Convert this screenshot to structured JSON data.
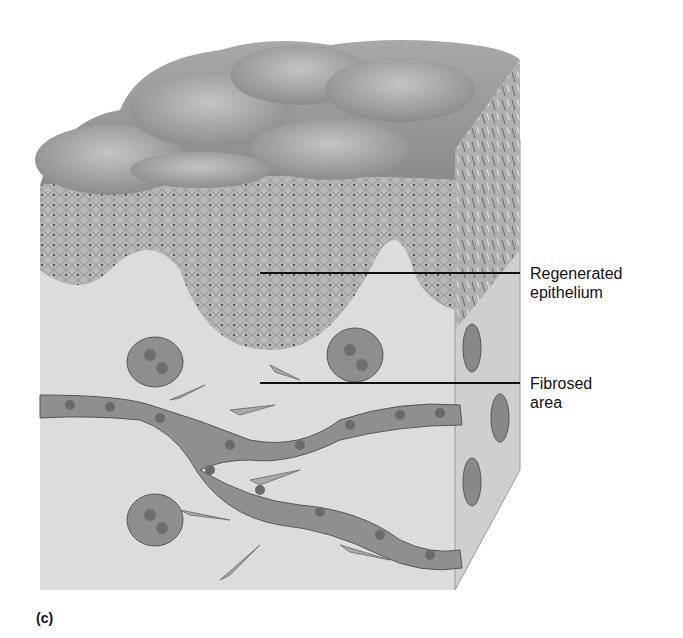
{
  "figure": {
    "panel_label": "(c)",
    "labels": [
      {
        "line1": "Regenerated",
        "line2": "epithelium"
      },
      {
        "line1": "Fibrosed",
        "line2": "area"
      }
    ]
  },
  "colors": {
    "surface": "#9a9a9a",
    "epithelium": "#b5b5b5",
    "connective": "#d9d9d9",
    "vessel": "#8c8c8c",
    "line": "#111111"
  }
}
